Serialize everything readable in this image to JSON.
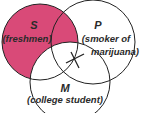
{
  "diagram": {
    "type": "venn-3",
    "fill_color": "#d94a78",
    "stroke_color": "#222222",
    "shaded_region": "S not M",
    "marker": "X",
    "marker_region": "P and M, not S",
    "sets": [
      {
        "letter": "S",
        "label": "(freshmen)"
      },
      {
        "letter": "P",
        "label_line1": "(smoker of",
        "label_line2": "marijuana)"
      },
      {
        "letter": "M",
        "label": "(college student)"
      }
    ]
  }
}
